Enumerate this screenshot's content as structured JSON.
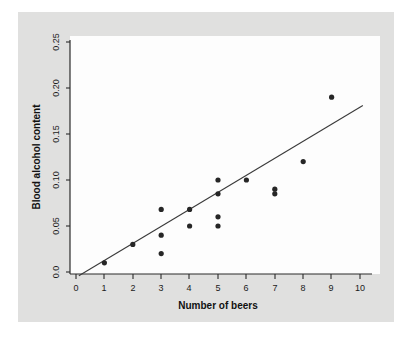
{
  "chart_data": {
    "type": "scatter",
    "title": "",
    "xlabel": "Number of beers",
    "ylabel": "Blood alcohol content",
    "xlim": [
      0,
      10.4
    ],
    "ylim": [
      -0.008,
      0.262
    ],
    "grid": false,
    "legend": null,
    "x_ticks": [
      "0",
      "1",
      "2",
      "3",
      "4",
      "5",
      "6",
      "7",
      "8",
      "9",
      "10"
    ],
    "x_tick_values": [
      0,
      1,
      2,
      3,
      4,
      5,
      6,
      7,
      8,
      9,
      10
    ],
    "y_ticks": [
      "0.0",
      "0.05",
      "0.10",
      "0.15",
      "0.20",
      "0.25"
    ],
    "y_tick_values": [
      0.0,
      0.05,
      0.1,
      0.15,
      0.2,
      0.25
    ],
    "series": [
      {
        "name": "students",
        "marker": "filled-circle",
        "color": "#262626",
        "points": [
          {
            "x": 1,
            "y": 0.01
          },
          {
            "x": 2,
            "y": 0.03
          },
          {
            "x": 3,
            "y": 0.068
          },
          {
            "x": 3,
            "y": 0.04
          },
          {
            "x": 3,
            "y": 0.02
          },
          {
            "x": 4,
            "y": 0.068
          },
          {
            "x": 4,
            "y": 0.05
          },
          {
            "x": 5,
            "y": 0.1
          },
          {
            "x": 5,
            "y": 0.085
          },
          {
            "x": 5,
            "y": 0.06
          },
          {
            "x": 5,
            "y": 0.05
          },
          {
            "x": 6,
            "y": 0.1
          },
          {
            "x": 7,
            "y": 0.09
          },
          {
            "x": 7,
            "y": 0.085
          },
          {
            "x": 8,
            "y": 0.12
          },
          {
            "x": 9,
            "y": 0.19
          }
        ]
      }
    ],
    "fit_line": {
      "name": "least-squares regression line",
      "color": "#3a3a3a",
      "x_start": 0.1,
      "y_start": -0.004,
      "x_end": 10.1,
      "y_end": 0.181
    }
  }
}
